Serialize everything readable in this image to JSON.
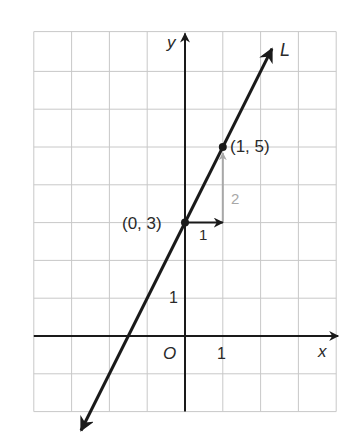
{
  "chart_data": {
    "type": "line",
    "title": "",
    "xlabel": "x",
    "ylabel": "y",
    "origin_label": "O",
    "line_label": "L",
    "xlim": [
      -4,
      4
    ],
    "ylim": [
      -2,
      8
    ],
    "grid": true,
    "x_tick_labels": [
      {
        "value": 1,
        "label": "1"
      }
    ],
    "y_tick_labels": [
      {
        "value": 1,
        "label": "1"
      }
    ],
    "series": [
      {
        "name": "L",
        "slope": 2,
        "intercept": 3,
        "x_range": [
          -2.75,
          2.3
        ],
        "arrows": "both"
      }
    ],
    "points": [
      {
        "x": 0,
        "y": 3,
        "label": "(0, 3)"
      },
      {
        "x": 1,
        "y": 5,
        "label": "(1, 5)"
      }
    ],
    "slope_triangle": {
      "run": {
        "from": [
          0,
          3
        ],
        "to": [
          1,
          3
        ],
        "label": "1"
      },
      "rise": {
        "from": [
          1,
          3
        ],
        "to": [
          1,
          5
        ],
        "label": "2"
      }
    },
    "colors": {
      "line": "#1a1a1a",
      "grid": "#c8c8c8",
      "rise": "#a8a8a8"
    }
  }
}
